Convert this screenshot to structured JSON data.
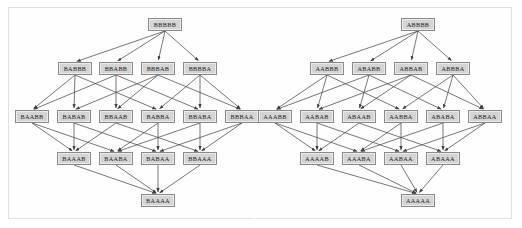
{
  "diagram": {
    "colors": {
      "page_background": "#ffffff",
      "frame_border": "#e2e2e2",
      "node_fill": "#d4d4d4",
      "node_border": "#8a8a8a",
      "node_text": "#1a1a1a",
      "edge": "#4a4a4a"
    },
    "left": {
      "name": "left-lattice-bbbbb",
      "root": "BBBBB",
      "levels": [
        {
          "index": 0,
          "labels": [
            "BBBBB"
          ]
        },
        {
          "index": 1,
          "labels": [
            "BABBB",
            "BBABB",
            "BBBAB",
            "BBBBA"
          ]
        },
        {
          "index": 2,
          "labels": [
            "BAABB",
            "BABAB",
            "BBAAB",
            "BABBA",
            "BBABA",
            "BBBAA"
          ]
        },
        {
          "index": 3,
          "labels": [
            "BAAAB",
            "BAABA",
            "BABAA",
            "BBAAA"
          ]
        },
        {
          "index": 4,
          "labels": [
            "BAAAA"
          ]
        }
      ]
    },
    "right": {
      "name": "right-lattice-abbbb",
      "root": "ABBBB",
      "levels": [
        {
          "index": 0,
          "labels": [
            "ABBBB"
          ]
        },
        {
          "index": 1,
          "labels": [
            "AABBB",
            "ABABB",
            "ABBAB",
            "ABBBA"
          ]
        },
        {
          "index": 2,
          "labels": [
            "AAABB",
            "AABAB",
            "ABAAB",
            "AABBA",
            "ABABA",
            "ABBAA"
          ]
        },
        {
          "index": 3,
          "labels": [
            "AAAAB",
            "AAABA",
            "AABAA",
            "ABAAA"
          ]
        },
        {
          "index": 4,
          "labels": [
            "AAAAA"
          ]
        }
      ]
    }
  }
}
